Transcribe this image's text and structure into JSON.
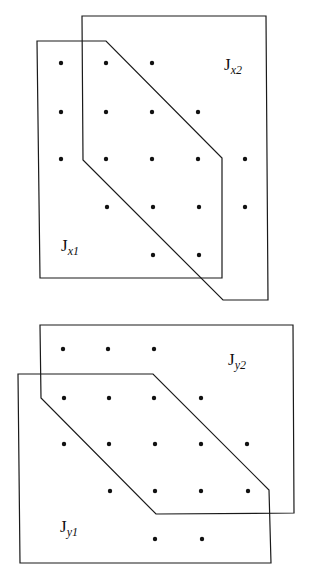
{
  "figures": [
    {
      "id": "top",
      "regions": [
        {
          "label_main": "J",
          "label_sub": "x2",
          "label_pos": [
            224,
            70
          ],
          "points": [
            [
              82,
              16
            ],
            [
              266,
              16
            ],
            [
              268,
              300
            ],
            [
              223,
              300
            ],
            [
              83,
              160
            ]
          ]
        },
        {
          "label_main": "J",
          "label_sub": "x1",
          "label_pos": [
            61,
            251
          ],
          "points": [
            [
              37,
              41
            ],
            [
              106,
              41
            ],
            [
              222,
              158
            ],
            [
              222,
              278
            ],
            [
              40,
              278
            ]
          ]
        }
      ],
      "dots": [
        [
          61,
          63
        ],
        [
          106,
          63
        ],
        [
          152,
          63
        ],
        [
          61,
          112
        ],
        [
          106,
          112
        ],
        [
          152,
          112
        ],
        [
          198,
          112
        ],
        [
          61,
          159
        ],
        [
          106,
          159
        ],
        [
          152,
          159
        ],
        [
          198,
          159
        ],
        [
          245,
          159
        ],
        [
          107,
          207
        ],
        [
          153,
          207
        ],
        [
          199,
          207
        ],
        [
          245,
          207
        ],
        [
          153,
          255
        ],
        [
          199,
          255
        ]
      ]
    },
    {
      "id": "bottom",
      "regions": [
        {
          "label_main": "J",
          "label_sub": "y2",
          "label_pos": [
            228,
            365
          ],
          "points": [
            [
              40,
              325
            ],
            [
              293,
              325
            ],
            [
              294,
              513
            ],
            [
              156,
              514
            ],
            [
              41,
              398
            ]
          ]
        },
        {
          "label_main": "J",
          "label_sub": "y1",
          "label_pos": [
            60,
            532
          ],
          "points": [
            [
              18,
              374
            ],
            [
              153,
              374
            ],
            [
              269,
              490
            ],
            [
              271,
              563
            ],
            [
              20,
              563
            ]
          ]
        }
      ],
      "dots": [
        [
          63,
          349
        ],
        [
          108,
          349
        ],
        [
          154,
          349
        ],
        [
          64,
          398
        ],
        [
          109,
          398
        ],
        [
          154,
          398
        ],
        [
          201,
          398
        ],
        [
          64,
          444
        ],
        [
          109,
          444
        ],
        [
          155,
          444
        ],
        [
          201,
          444
        ],
        [
          247,
          444
        ],
        [
          110,
          491
        ],
        [
          155,
          491
        ],
        [
          201,
          491
        ],
        [
          248,
          491
        ],
        [
          155,
          539
        ],
        [
          202,
          539
        ]
      ]
    }
  ],
  "labels": {
    "jx2": {
      "main": "J",
      "sub": "x2"
    },
    "jx1": {
      "main": "J",
      "sub": "x1"
    },
    "jy2": {
      "main": "J",
      "sub": "y2"
    },
    "jy1": {
      "main": "J",
      "sub": "y1"
    }
  }
}
